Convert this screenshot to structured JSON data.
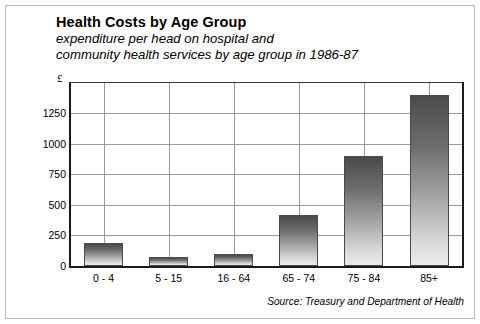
{
  "chart": {
    "title": "Health Costs by Age Group",
    "subtitle_line1": "expenditure per head on hospital and",
    "subtitle_line2": "community health services by age group in 1986-87",
    "y_unit_symbol": "£",
    "source": "Source: Treasury and Department of Health"
  },
  "chart_data": {
    "type": "bar",
    "title": "Health Costs by Age Group",
    "subtitle": "expenditure per head on hospital and community health services by age group in 1986-87",
    "xlabel": "",
    "ylabel": "£",
    "categories": [
      "0 - 4",
      "5 - 15",
      "16 - 64",
      "65 - 74",
      "75 - 84",
      "85+"
    ],
    "values": [
      185,
      70,
      95,
      420,
      900,
      1400
    ],
    "ylim": [
      0,
      1500
    ],
    "yticks": [
      0,
      250,
      500,
      750,
      1000,
      1250
    ],
    "ytick_labels": [
      "0",
      "250",
      "500",
      "750",
      "1000",
      "1250"
    ],
    "grid": true,
    "legend": false,
    "annotation": "Source: Treasury and Department of Health",
    "bar_fill": "vertical gradient dark grey top to light grey bottom",
    "bar_edge_color": "#4a4a4a"
  }
}
